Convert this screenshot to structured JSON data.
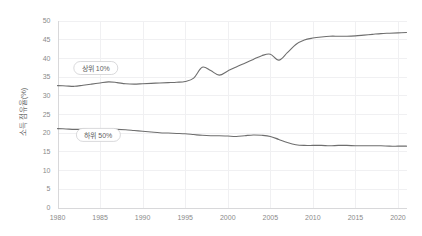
{
  "chart_data": {
    "type": "line",
    "title": "",
    "xlabel": "",
    "ylabel": "소득 점유율(%)",
    "xlim": [
      1980,
      2021
    ],
    "ylim": [
      0,
      50
    ],
    "grid": true,
    "legend_position": "inline-labels",
    "x_ticks": [
      "1980",
      "1985",
      "1990",
      "1995",
      "2000",
      "2005",
      "2010",
      "2015",
      "2020"
    ],
    "x_tick_values": [
      1980,
      1985,
      1990,
      1995,
      2000,
      2005,
      2010,
      2015,
      2020
    ],
    "y_ticks": [
      "0",
      "5",
      "10",
      "15",
      "20",
      "25",
      "30",
      "35",
      "40",
      "45",
      "50"
    ],
    "y_tick_values": [
      0,
      5,
      10,
      15,
      20,
      25,
      30,
      35,
      40,
      45,
      50
    ],
    "x": [
      1980,
      1981,
      1982,
      1983,
      1984,
      1985,
      1986,
      1987,
      1988,
      1989,
      1990,
      1991,
      1992,
      1993,
      1994,
      1995,
      1996,
      1997,
      1998,
      1999,
      2000,
      2001,
      2002,
      2003,
      2004,
      2005,
      2006,
      2007,
      2008,
      2009,
      2010,
      2011,
      2012,
      2013,
      2014,
      2015,
      2016,
      2017,
      2018,
      2019,
      2020,
      2021
    ],
    "series": [
      {
        "name": "상위 10%",
        "color": "#6e6e6e",
        "label_x": 1984.5,
        "label_y": 37.3,
        "values": [
          32.6,
          32.5,
          32.4,
          32.7,
          33.0,
          33.3,
          33.6,
          33.4,
          33.1,
          33.0,
          33.1,
          33.2,
          33.3,
          33.4,
          33.5,
          33.7,
          34.6,
          37.5,
          36.6,
          35.4,
          36.5,
          37.6,
          38.6,
          39.6,
          40.6,
          41.0,
          39.4,
          41.4,
          43.6,
          44.8,
          45.3,
          45.6,
          45.8,
          45.8,
          45.8,
          45.9,
          46.1,
          46.3,
          46.5,
          46.6,
          46.7,
          46.8
        ]
      },
      {
        "name": "하위 50%",
        "color": "#6e6e6e",
        "label_x": 1984.8,
        "label_y": 19.4,
        "values": [
          21.1,
          21.0,
          20.9,
          20.9,
          20.8,
          20.7,
          20.8,
          20.9,
          20.8,
          20.6,
          20.4,
          20.2,
          20.0,
          19.9,
          19.8,
          19.7,
          19.5,
          19.3,
          19.2,
          19.2,
          19.1,
          19.0,
          19.2,
          19.4,
          19.3,
          19.0,
          18.2,
          17.4,
          16.8,
          16.6,
          16.6,
          16.6,
          16.5,
          16.6,
          16.6,
          16.5,
          16.5,
          16.5,
          16.5,
          16.4,
          16.4,
          16.4
        ]
      }
    ]
  }
}
